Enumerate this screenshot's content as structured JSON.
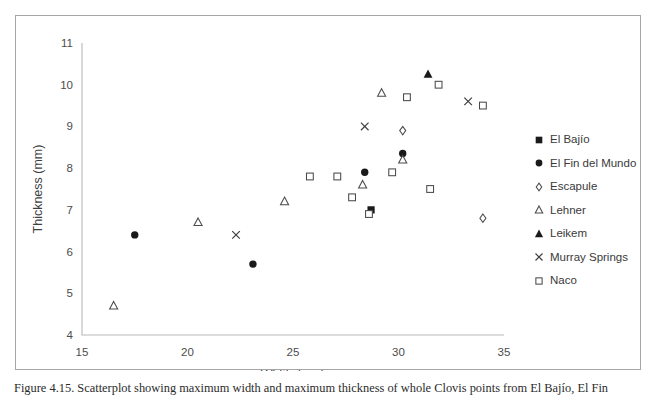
{
  "figure": {
    "caption": "Figure 4.15. Scatterplot showing maximum width and maximum thickness of whole Clovis points from El Bajío, El Fin",
    "border_color": "#a6a6a6"
  },
  "chart_data": {
    "type": "scatter",
    "title": "",
    "xlabel": "Width (mm)",
    "ylabel": "Thickness (mm)",
    "xlim": [
      15,
      35
    ],
    "ylim": [
      4,
      11
    ],
    "xticks": [
      15,
      20,
      25,
      30,
      35
    ],
    "yticks": [
      4,
      5,
      6,
      7,
      8,
      9,
      10,
      11
    ],
    "grid": false,
    "legend_position": "right",
    "axis_color": "#b9b9b9",
    "marker_color": "#1a1a1a",
    "series": [
      {
        "name": "El Bajío",
        "marker": "filled-square",
        "points": [
          [
            28.7,
            7.0
          ]
        ]
      },
      {
        "name": "El Fin del Mundo",
        "marker": "filled-circle",
        "points": [
          [
            17.5,
            6.4
          ],
          [
            23.1,
            5.7
          ],
          [
            28.4,
            7.9
          ],
          [
            30.2,
            8.35
          ]
        ]
      },
      {
        "name": "Escapule",
        "marker": "open-diamond",
        "points": [
          [
            30.2,
            8.9
          ],
          [
            34.0,
            6.8
          ]
        ]
      },
      {
        "name": "Lehner",
        "marker": "open-triangle",
        "points": [
          [
            16.5,
            4.7
          ],
          [
            20.5,
            6.7
          ],
          [
            24.6,
            7.2
          ],
          [
            28.3,
            7.6
          ],
          [
            29.2,
            9.8
          ],
          [
            30.2,
            8.2
          ]
        ]
      },
      {
        "name": "Leikem",
        "marker": "filled-triangle",
        "points": [
          [
            31.4,
            10.25
          ]
        ]
      },
      {
        "name": "Murray Springs",
        "marker": "cross",
        "points": [
          [
            22.3,
            6.4
          ],
          [
            28.4,
            9.0
          ],
          [
            33.3,
            9.6
          ]
        ]
      },
      {
        "name": "Naco",
        "marker": "open-square",
        "points": [
          [
            25.8,
            7.8
          ],
          [
            27.1,
            7.8
          ],
          [
            27.8,
            7.3
          ],
          [
            28.6,
            6.9
          ],
          [
            29.7,
            7.9
          ],
          [
            30.4,
            9.7
          ],
          [
            31.5,
            7.5
          ],
          [
            31.9,
            10.0
          ],
          [
            34.0,
            9.5
          ]
        ]
      }
    ]
  },
  "legend": {
    "entries": [
      {
        "label": "El Bajío",
        "marker": "filled-square"
      },
      {
        "label": "El Fin del Mundo",
        "marker": "filled-circle"
      },
      {
        "label": "Escapule",
        "marker": "open-diamond"
      },
      {
        "label": "Lehner",
        "marker": "open-triangle"
      },
      {
        "label": "Leikem",
        "marker": "filled-triangle"
      },
      {
        "label": "Murray Springs",
        "marker": "cross"
      },
      {
        "label": "Naco",
        "marker": "open-square"
      }
    ]
  }
}
